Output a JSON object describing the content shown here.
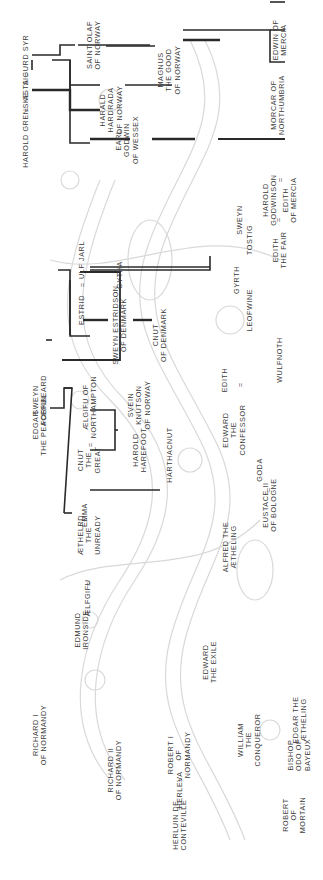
{
  "diagram": {
    "type": "family-tree",
    "orientation": "rotated-90-counterclockwise",
    "line_color": "#2a2a2a",
    "background_art_color": "#d8d8d8"
  },
  "people": {
    "sigurd_syr": {
      "lines": [
        "SIGURD SYR"
      ]
    },
    "asta": {
      "lines": [
        "ASTA"
      ]
    },
    "harold_grenske": {
      "lines": [
        "HAROLD GRENSKE"
      ]
    },
    "saint_olaf": {
      "lines": [
        "SAINT OLAF",
        "OF NORWAY"
      ]
    },
    "harald_hardrada": {
      "lines": [
        "HARALD",
        "HARDRADA",
        "OF NORWAY"
      ]
    },
    "magnus": {
      "lines": [
        "MAGNUS",
        "THE GOOD",
        "OF NORWAY"
      ]
    },
    "earl_godwin": {
      "lines": [
        "EARL",
        "GODWIN",
        "OF WESSEX"
      ]
    },
    "gytha": {
      "lines": [
        "GYTHA"
      ]
    },
    "ulf_jarl": {
      "lines": [
        "ULF JARL"
      ]
    },
    "estrid": {
      "lines": [
        "ESTRID"
      ]
    },
    "sweyn_estridson": {
      "lines": [
        "SWEYN ESTRIDSON",
        "OF DENMARK"
      ]
    },
    "cnut_of_denmark": {
      "lines": [
        "CNUT",
        "OF DENMARK"
      ]
    },
    "sweyn_forkbeard": {
      "lines": [
        "SWEYN",
        "FORKBEARD"
      ]
    },
    "aelgifu_northampton": {
      "lines": [
        "ÆLGIFU OF",
        "NORTHAMPTON"
      ]
    },
    "cnut_the_great": {
      "lines": [
        "CNUT",
        "THE",
        "GREAT"
      ]
    },
    "svein_knutson": {
      "lines": [
        "SVEIN",
        "KNUTSON",
        "OF NORWAY"
      ]
    },
    "harold_harefoot": {
      "lines": [
        "HAROLD",
        "HAREFOOT"
      ]
    },
    "harthacnut": {
      "lines": [
        "HARTHACNUT"
      ]
    },
    "edgar_peaceful": {
      "lines": [
        "EDGAR",
        "THE PEACEFUL"
      ]
    },
    "emma": {
      "lines": [
        "EMMA"
      ]
    },
    "aethelred": {
      "lines": [
        "ÆTHELRD",
        "THE",
        "UNREADY"
      ]
    },
    "aelfgifu": {
      "lines": [
        "ÆLFGIFU"
      ]
    },
    "edmund_ironside": {
      "lines": [
        "EDMUND",
        "IRONSIDE"
      ]
    },
    "edward_exile": {
      "lines": [
        "EDWARD",
        "THE EXILE"
      ]
    },
    "edgar_aetheling": {
      "lines": [
        "EDGAR THE",
        "ÆTHELING"
      ]
    },
    "alfred_aetheling": {
      "lines": [
        "ALFRED THE",
        "ÆTHELING"
      ]
    },
    "goda": {
      "lines": [
        "GODA"
      ]
    },
    "eustace": {
      "lines": [
        "EUSTACE II",
        "OF BOLOGNE"
      ]
    },
    "edward_confessor": {
      "lines": [
        "EDWARD",
        "THE",
        "CONFESSOR"
      ]
    },
    "edith_wessex": {
      "lines": [
        "EDITH"
      ]
    },
    "wulfnoth": {
      "lines": [
        "WULFNOTH"
      ]
    },
    "leofwine": {
      "lines": [
        "LEOFWINE"
      ]
    },
    "gyrth": {
      "lines": [
        "GYRTH"
      ]
    },
    "tostig": {
      "lines": [
        "TOSTIG"
      ]
    },
    "harold_godwinson": {
      "lines": [
        "HAROLD",
        "GODWINSON"
      ]
    },
    "edith_the_fair": {
      "lines": [
        "EDITH",
        "THE FAIR"
      ]
    },
    "sweyn_godwinson": {
      "lines": [
        "SWEYN"
      ]
    },
    "edith_mercia": {
      "lines": [
        "EDITH",
        "OF MERCIA"
      ]
    },
    "morcar": {
      "lines": [
        "MORCAR OF",
        "NORTHUMBRIA"
      ]
    },
    "edwin": {
      "lines": [
        "EDWIN OF",
        "MERCIA"
      ]
    },
    "richard_i": {
      "lines": [
        "RICHARD I",
        "OF NORMANDY"
      ]
    },
    "richard_ii": {
      "lines": [
        "RICHARD II",
        "OF NORMANDY"
      ]
    },
    "robert_i": {
      "lines": [
        "ROBERT I",
        "OF",
        "NORMANDY"
      ]
    },
    "herleva": {
      "lines": [
        "HERLEVA"
      ]
    },
    "herluin": {
      "lines": [
        "HERLUIN DE",
        "CONTEVILLE"
      ]
    },
    "william": {
      "lines": [
        "WILLIAM",
        "THE",
        "CONQUEROR"
      ]
    },
    "odo": {
      "lines": [
        "BISHOP",
        "ODO OF",
        "BAYEUX"
      ]
    },
    "robert_mortain": {
      "lines": [
        "ROBERT",
        "OF",
        "MORTAIN"
      ]
    }
  },
  "marriage_symbol": "="
}
